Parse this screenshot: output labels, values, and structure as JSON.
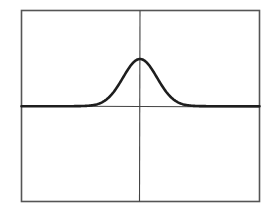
{
  "chart_data": {
    "type": "line",
    "title": "",
    "xlabel": "",
    "ylabel": "",
    "grid": false,
    "legend": null,
    "axes": {
      "frame": true,
      "vertical_center_line": true,
      "horizontal_baseline": true,
      "tick_labels_visible": false
    },
    "series": [
      {
        "name": "gaussian-pulse",
        "shape": "bell curve (single Gaussian peak) centered on vertical axis",
        "baseline_level": 0,
        "peak_x": 0,
        "peak_height_fraction_of_upper_half": 0.5,
        "x": [
          -1.0,
          -0.5,
          -0.4,
          -0.3,
          -0.2,
          -0.1,
          0.0,
          0.1,
          0.2,
          0.3,
          0.4,
          0.5,
          1.0
        ],
        "values": [
          0.0,
          0.0,
          0.02,
          0.12,
          0.42,
          0.82,
          1.0,
          0.82,
          0.42,
          0.12,
          0.02,
          0.0,
          0.0
        ]
      }
    ],
    "colors": {
      "frame": "#444444",
      "curve": "#222222",
      "background": "#ffffff"
    }
  }
}
